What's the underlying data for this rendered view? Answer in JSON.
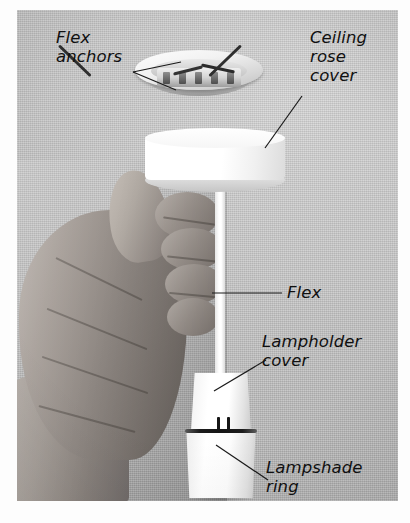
{
  "figure": {
    "type": "annotated-photograph",
    "palette": {
      "background": "#b6b6b6",
      "plate_border": "#fdfdfd",
      "label_text": "#101010",
      "leader_line": "#1a1a1a",
      "plastic_white": "#ffffff",
      "wire_dark": "#2e2e2e",
      "skin_mid": "#a69e98"
    }
  },
  "labels": {
    "flex_anchors": "Flex\nanchors",
    "ceiling_rose_cover": "Ceiling\nrose\ncover",
    "flex": "Flex",
    "lampholder_cover": "Lampholder\ncover",
    "lampshade_ring": "Lampshade\nring"
  },
  "parts": {
    "ceiling_rose_base": "ceiling rose base with terminal block",
    "ceiling_rose_cover": "white ceiling rose cover drum",
    "flex": "white flex cord",
    "lampholder_cover": "tapered lampholder cover",
    "lampshade_ring": "lampshade ring",
    "hand": "hand gripping assembly"
  }
}
